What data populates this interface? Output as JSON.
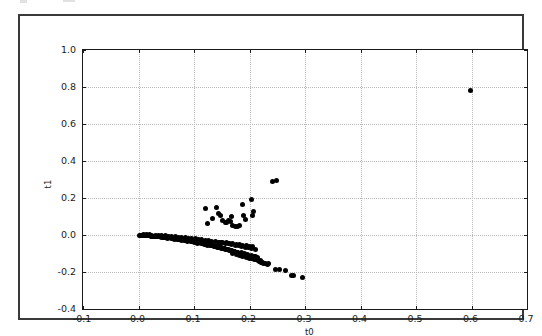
{
  "chart_data": {
    "type": "scatter",
    "title": "",
    "xlabel": "t0",
    "ylabel": "t1",
    "xlim": [
      -0.1,
      0.7
    ],
    "ylim": [
      -0.4,
      1.0
    ],
    "xticks": [
      -0.1,
      0.0,
      0.1,
      0.2,
      0.3,
      0.4,
      0.5,
      0.6,
      0.7
    ],
    "xticklabels": [
      "-0.1",
      "0.0",
      "0.1",
      "0.2",
      "0.3",
      "0.4",
      "0.5",
      "0.6",
      "0.7"
    ],
    "yticks": [
      -0.4,
      -0.2,
      0.0,
      0.2,
      0.4,
      0.6,
      0.8,
      1.0
    ],
    "yticklabels": [
      "-0.4",
      "-0.2",
      "0.0",
      "0.2",
      "0.4",
      "0.6",
      "0.8",
      "1.0"
    ],
    "grid": true,
    "grid_style": "dotted",
    "grid_color": "#b9b9b9",
    "legend": null,
    "marker": "circle",
    "marker_color": "#000000",
    "marker_size": 5,
    "series": [
      {
        "name": "t0 vs t1",
        "points": [
          [
            0.002,
            -0.0005
          ],
          [
            0.0045,
            -0.001
          ],
          [
            0.0062,
            -0.0014
          ],
          [
            0.008,
            -0.0018
          ],
          [
            0.0098,
            -0.0022
          ],
          [
            0.0115,
            -0.0026
          ],
          [
            0.0132,
            -0.003
          ],
          [
            0.015,
            -0.0034
          ],
          [
            0.0168,
            -0.0038
          ],
          [
            0.0185,
            -0.0042
          ],
          [
            0.0202,
            -0.0046
          ],
          [
            0.022,
            -0.005
          ],
          [
            0.0238,
            -0.0055
          ],
          [
            0.0255,
            -0.006
          ],
          [
            0.0272,
            -0.0064
          ],
          [
            0.029,
            -0.0068
          ],
          [
            0.0308,
            -0.0072
          ],
          [
            0.0325,
            -0.0078
          ],
          [
            0.0342,
            -0.0082
          ],
          [
            0.036,
            -0.0086
          ],
          [
            0.0378,
            -0.0092
          ],
          [
            0.0395,
            -0.0096
          ],
          [
            0.0412,
            -0.0102
          ],
          [
            0.043,
            -0.0108
          ],
          [
            0.0448,
            -0.0112
          ],
          [
            0.0465,
            -0.0118
          ],
          [
            0.0482,
            -0.0124
          ],
          [
            0.05,
            -0.013
          ],
          [
            0.0518,
            -0.0136
          ],
          [
            0.0535,
            -0.0142
          ],
          [
            0.0552,
            -0.0148
          ],
          [
            0.057,
            -0.0155
          ],
          [
            0.0588,
            -0.0161
          ],
          [
            0.0605,
            -0.0168
          ],
          [
            0.0622,
            -0.0174
          ],
          [
            0.064,
            -0.0182
          ],
          [
            0.0658,
            -0.0188
          ],
          [
            0.0675,
            -0.0196
          ],
          [
            0.0692,
            -0.0203
          ],
          [
            0.071,
            -0.021
          ],
          [
            0.0728,
            -0.0218
          ],
          [
            0.0745,
            -0.0226
          ],
          [
            0.0762,
            -0.0233
          ],
          [
            0.078,
            -0.0242
          ],
          [
            0.0798,
            -0.025
          ],
          [
            0.0815,
            -0.0258
          ],
          [
            0.0832,
            -0.0266
          ],
          [
            0.085,
            -0.0275
          ],
          [
            0.0868,
            -0.0283
          ],
          [
            0.0885,
            -0.0292
          ],
          [
            0.0902,
            -0.03
          ],
          [
            0.092,
            -0.031
          ],
          [
            0.0938,
            -0.0319
          ],
          [
            0.0955,
            -0.0328
          ],
          [
            0.0972,
            -0.0338
          ],
          [
            0.099,
            -0.0348
          ],
          [
            0.1008,
            -0.0357
          ],
          [
            0.1025,
            -0.0367
          ],
          [
            0.1042,
            -0.0377
          ],
          [
            0.106,
            -0.0388
          ],
          [
            0.1078,
            -0.0398
          ],
          [
            0.1095,
            -0.0409
          ],
          [
            0.1112,
            -0.042
          ],
          [
            0.113,
            -0.0431
          ],
          [
            0.1148,
            -0.0442
          ],
          [
            0.1165,
            -0.0453
          ],
          [
            0.1182,
            -0.0465
          ],
          [
            0.12,
            -0.0477
          ],
          [
            0.1218,
            -0.0488
          ],
          [
            0.1235,
            -0.05
          ],
          [
            0.1252,
            -0.0512
          ],
          [
            0.127,
            -0.0525
          ],
          [
            0.1288,
            -0.0537
          ],
          [
            0.1305,
            -0.055
          ],
          [
            0.1322,
            -0.0562
          ],
          [
            0.134,
            -0.0576
          ],
          [
            0.1358,
            -0.0589
          ],
          [
            0.1375,
            -0.0602
          ],
          [
            0.1392,
            -0.0616
          ],
          [
            0.141,
            -0.063
          ],
          [
            0.1428,
            -0.0643
          ],
          [
            0.1445,
            -0.0658
          ],
          [
            0.1462,
            -0.0672
          ],
          [
            0.148,
            -0.0686
          ],
          [
            0.1498,
            -0.0701
          ],
          [
            0.1515,
            -0.0716
          ],
          [
            0.1532,
            -0.0731
          ],
          [
            0.155,
            -0.0746
          ],
          [
            0.1568,
            -0.0761
          ],
          [
            0.1585,
            -0.0777
          ],
          [
            0.1602,
            -0.0792
          ],
          [
            0.162,
            -0.0808
          ],
          [
            0.1638,
            -0.0824
          ],
          [
            0.1655,
            -0.0841
          ],
          [
            0.1672,
            -0.0857
          ],
          [
            0.169,
            -0.0874
          ],
          [
            0.1708,
            -0.089
          ],
          [
            0.1725,
            -0.0908
          ],
          [
            0.1742,
            -0.0925
          ],
          [
            0.176,
            -0.0942
          ],
          [
            0.1778,
            -0.096
          ],
          [
            0.1795,
            -0.0978
          ],
          [
            0.1812,
            -0.0996
          ],
          [
            0.183,
            -0.1014
          ],
          [
            0.1848,
            -0.1033
          ],
          [
            0.1865,
            -0.1052
          ],
          [
            0.1882,
            -0.107
          ],
          [
            0.19,
            -0.109
          ],
          [
            0.1918,
            -0.1109
          ],
          [
            0.1935,
            -0.1129
          ],
          [
            0.1952,
            -0.1148
          ],
          [
            0.197,
            -0.1168
          ],
          [
            0.1988,
            -0.1189
          ],
          [
            0.2005,
            -0.1209
          ],
          [
            0.2022,
            -0.123
          ],
          [
            0.204,
            -0.1251
          ],
          [
            0.2058,
            -0.1272
          ],
          [
            0.2075,
            -0.1294
          ],
          [
            0.2092,
            -0.1315
          ],
          [
            0.211,
            -0.1337
          ],
          [
            0.009,
            0.001
          ],
          [
            0.014,
            0.0008
          ],
          [
            0.019,
            0.0004
          ],
          [
            0.024,
            0.0
          ],
          [
            0.03,
            -0.0012
          ],
          [
            0.036,
            -0.0024
          ],
          [
            0.042,
            -0.0036
          ],
          [
            0.048,
            -0.005
          ],
          [
            0.054,
            -0.0062
          ],
          [
            0.06,
            -0.0078
          ],
          [
            0.066,
            -0.0092
          ],
          [
            0.072,
            -0.011
          ],
          [
            0.078,
            -0.0126
          ],
          [
            0.084,
            -0.0146
          ],
          [
            0.09,
            -0.0164
          ],
          [
            0.096,
            -0.0186
          ],
          [
            0.102,
            -0.0206
          ],
          [
            0.108,
            -0.023
          ],
          [
            0.114,
            -0.0252
          ],
          [
            0.12,
            -0.0278
          ],
          [
            0.126,
            -0.0302
          ],
          [
            0.132,
            -0.033
          ],
          [
            0.138,
            -0.0356
          ],
          [
            0.144,
            -0.0386
          ],
          [
            0.15,
            -0.0414
          ],
          [
            0.156,
            -0.0446
          ],
          [
            0.162,
            -0.0476
          ],
          [
            0.168,
            -0.051
          ],
          [
            0.174,
            -0.0542
          ],
          [
            0.18,
            -0.0578
          ],
          [
            0.186,
            -0.0612
          ],
          [
            0.192,
            -0.065
          ],
          [
            0.198,
            -0.0686
          ],
          [
            0.204,
            -0.0726
          ],
          [
            0.21,
            -0.0764
          ],
          [
            0.011,
            -0.003
          ],
          [
            0.017,
            -0.0048
          ],
          [
            0.023,
            -0.0066
          ],
          [
            0.029,
            -0.0086
          ],
          [
            0.035,
            -0.0108
          ],
          [
            0.041,
            -0.013
          ],
          [
            0.047,
            -0.0154
          ],
          [
            0.053,
            -0.0178
          ],
          [
            0.059,
            -0.0204
          ],
          [
            0.065,
            -0.023
          ],
          [
            0.071,
            -0.0258
          ],
          [
            0.077,
            -0.0286
          ],
          [
            0.083,
            -0.0316
          ],
          [
            0.089,
            -0.0346
          ],
          [
            0.095,
            -0.0378
          ],
          [
            0.101,
            -0.041
          ],
          [
            0.107,
            -0.0444
          ],
          [
            0.113,
            -0.0478
          ],
          [
            0.119,
            -0.0514
          ],
          [
            0.125,
            -0.055
          ],
          [
            0.131,
            -0.0588
          ],
          [
            0.137,
            -0.0626
          ],
          [
            0.143,
            -0.0666
          ],
          [
            0.149,
            -0.0706
          ],
          [
            0.155,
            -0.0748
          ],
          [
            0.161,
            -0.079
          ],
          [
            0.167,
            -0.0834
          ],
          [
            0.173,
            -0.0878
          ],
          [
            0.179,
            -0.0924
          ],
          [
            0.185,
            -0.097
          ],
          [
            0.191,
            -0.1018
          ],
          [
            0.197,
            -0.1066
          ],
          [
            0.203,
            -0.1116
          ],
          [
            0.209,
            -0.1166
          ],
          [
            0.215,
            -0.1218
          ],
          [
            0.146,
            -0.039
          ],
          [
            0.152,
            -0.0408
          ],
          [
            0.158,
            -0.0428
          ],
          [
            0.164,
            -0.0448
          ],
          [
            0.17,
            -0.047
          ],
          [
            0.176,
            -0.0494
          ],
          [
            0.182,
            -0.052
          ],
          [
            0.188,
            -0.0548
          ],
          [
            0.194,
            -0.0578
          ],
          [
            0.2,
            -0.061
          ],
          [
            0.206,
            -0.0644
          ],
          [
            0.17,
            -0.102
          ],
          [
            0.176,
            -0.1062
          ],
          [
            0.182,
            -0.1104
          ],
          [
            0.188,
            -0.1148
          ],
          [
            0.194,
            -0.1196
          ],
          [
            0.2,
            -0.1244
          ],
          [
            0.206,
            -0.1296
          ],
          [
            0.212,
            -0.1348
          ],
          [
            0.216,
            -0.1392
          ],
          [
            0.218,
            -0.1424
          ],
          [
            0.22,
            -0.1452
          ],
          [
            0.222,
            -0.1478
          ],
          [
            0.213,
            -0.13
          ],
          [
            0.215,
            -0.134
          ],
          [
            0.217,
            -0.1366
          ],
          [
            0.219,
            -0.14
          ],
          [
            0.2205,
            -0.1432
          ],
          [
            0.2215,
            -0.1468
          ],
          [
            0.223,
            -0.15
          ],
          [
            0.2245,
            -0.153
          ],
          [
            0.21,
            -0.118
          ],
          [
            0.212,
            -0.122
          ],
          [
            0.214,
            -0.1258
          ],
          [
            0.229,
            -0.156
          ],
          [
            0.232,
            -0.1596
          ],
          [
            0.235,
            -0.156
          ],
          [
            0.246,
            -0.184
          ],
          [
            0.254,
            -0.186
          ],
          [
            0.264,
            -0.193
          ],
          [
            0.276,
            -0.217
          ],
          [
            0.279,
            -0.221
          ],
          [
            0.296,
            -0.228
          ],
          [
            0.12,
            0.143
          ],
          [
            0.124,
            0.062
          ],
          [
            0.133,
            0.088
          ],
          [
            0.14,
            0.147
          ],
          [
            0.145,
            0.114
          ],
          [
            0.148,
            0.106
          ],
          [
            0.152,
            0.081
          ],
          [
            0.156,
            0.07
          ],
          [
            0.159,
            0.066
          ],
          [
            0.162,
            0.079
          ],
          [
            0.165,
            0.075
          ],
          [
            0.168,
            0.102
          ],
          [
            0.17,
            0.05
          ],
          [
            0.174,
            0.047
          ],
          [
            0.178,
            0.046
          ],
          [
            0.182,
            0.049
          ],
          [
            0.188,
            0.164
          ],
          [
            0.19,
            0.107
          ],
          [
            0.192,
            0.086
          ],
          [
            0.203,
            0.19
          ],
          [
            0.206,
            0.106
          ],
          [
            0.208,
            0.125
          ],
          [
            0.242,
            0.29
          ],
          [
            0.248,
            0.292
          ],
          [
            0.598,
            0.78
          ]
        ]
      }
    ]
  },
  "axes": {
    "x_label": "t0",
    "y_label": "t1"
  }
}
